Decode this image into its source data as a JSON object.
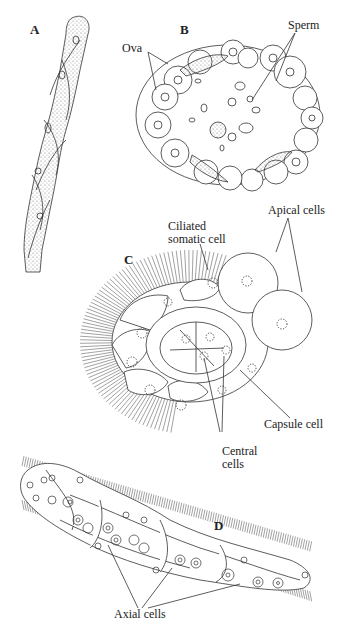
{
  "panels": {
    "a": {
      "letter": "A"
    },
    "b": {
      "letter": "B",
      "labels": {
        "ova": "Ova",
        "sperm": "Sperm"
      }
    },
    "c": {
      "letter": "C",
      "labels": {
        "ciliated_line1": "Ciliated",
        "ciliated_line2": "somatic cell",
        "apical": "Apical cells",
        "capsule": "Capsule cell",
        "central_line1": "Central",
        "central_line2": "cells"
      }
    },
    "d": {
      "letter": "D",
      "labels": {
        "axial": "Axial cells"
      }
    }
  },
  "colors": {
    "ink": "#222222",
    "background": "#ffffff",
    "stipple": "#888888"
  }
}
